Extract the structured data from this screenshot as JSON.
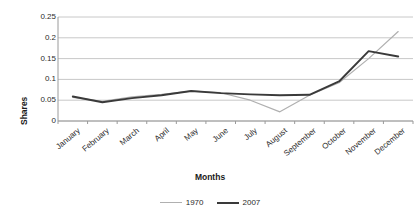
{
  "chart_data": {
    "type": "line",
    "title": "",
    "xlabel": "Months",
    "ylabel": "Shares",
    "categories": [
      "January",
      "February",
      "March",
      "April",
      "May",
      "June",
      "July",
      "August",
      "September",
      "October",
      "November",
      "December"
    ],
    "series": [
      {
        "name": "1970",
        "color": "#b0b0b0",
        "values": [
          0.057,
          0.047,
          0.058,
          0.064,
          0.072,
          0.068,
          0.05,
          0.022,
          0.062,
          0.092,
          0.15,
          0.215
        ]
      },
      {
        "name": "2007",
        "color": "#3a3a3a",
        "values": [
          0.059,
          0.045,
          0.055,
          0.062,
          0.072,
          0.067,
          0.064,
          0.062,
          0.063,
          0.095,
          0.168,
          0.155
        ]
      }
    ],
    "ylim": [
      0,
      0.25
    ],
    "yticks": [
      "0",
      "0.05",
      "0.1",
      "0.15",
      "0.2",
      "0.25"
    ],
    "ytick_values": [
      0,
      0.05,
      0.1,
      0.15,
      0.2,
      0.25
    ],
    "grid": true,
    "legend_position": "bottom",
    "legend_entries": [
      "1970",
      "2007"
    ]
  },
  "axis": {
    "y_title": "Shares",
    "x_title": "Months"
  },
  "colors": {
    "series_1970": "#b0b0b0",
    "series_2007": "#3a3a3a",
    "gridline": "#c8c8c8",
    "axis": "#8a8a8a",
    "text": "#2b2b2b"
  }
}
